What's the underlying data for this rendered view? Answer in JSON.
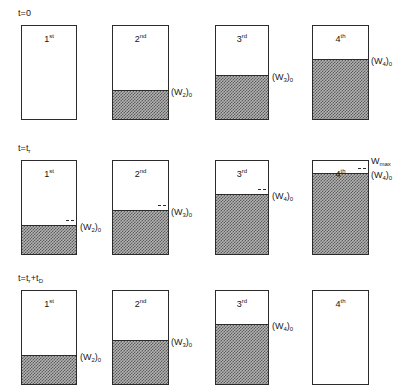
{
  "figure": {
    "type": "process-schematic",
    "vessel_count": 4,
    "row_count": 3
  },
  "rows": [
    {
      "id": "row-t0",
      "time_label": "t=0",
      "time_label_html": "t=0",
      "vessels": [
        {
          "name": "1st",
          "ordinal": "1",
          "suffix": "st",
          "fill_fraction": 0.0,
          "side_label": "",
          "side_label_base": "",
          "side_label_sub": "",
          "tick": false
        },
        {
          "name": "2nd",
          "ordinal": "2",
          "suffix": "nd",
          "fill_fraction": 0.29,
          "side_label": "(W2)0",
          "side_label_base": "(W",
          "side_label_sub": "2",
          "tick": false
        },
        {
          "name": "3rd",
          "ordinal": "3",
          "suffix": "rd",
          "fill_fraction": 0.45,
          "side_label": "(W3)0",
          "side_label_base": "(W",
          "side_label_sub": "3",
          "tick": false
        },
        {
          "name": "4th",
          "ordinal": "4",
          "suffix": "th",
          "fill_fraction": 0.62,
          "side_label": "(W4)0",
          "side_label_base": "(W",
          "side_label_sub": "4",
          "tick": false
        }
      ]
    },
    {
      "id": "row-tr",
      "time_label": "t=tr",
      "time_label_html": "t=t",
      "time_label_sub": "r",
      "vessels": [
        {
          "name": "1st",
          "ordinal": "1",
          "suffix": "st",
          "fill_fraction": 0.29,
          "side_label": "(W2)0",
          "side_label_base": "(W",
          "side_label_sub": "2",
          "tick": true
        },
        {
          "name": "2nd",
          "ordinal": "2",
          "suffix": "nd",
          "fill_fraction": 0.45,
          "side_label": "(W3)0",
          "side_label_base": "(W",
          "side_label_sub": "3",
          "tick": true
        },
        {
          "name": "3rd",
          "ordinal": "3",
          "suffix": "rd",
          "fill_fraction": 0.62,
          "side_label": "(W4)0",
          "side_label_base": "(W",
          "side_label_sub": "4",
          "tick": true
        },
        {
          "name": "4th",
          "ordinal": "4",
          "suffix": "th",
          "fill_fraction": 0.84,
          "side_label": "(W4)0",
          "side_label_base": "(W",
          "side_label_sub": "4",
          "tick": true,
          "top_label": "Wmax",
          "top_label_base": "W",
          "top_label_sub": "max"
        }
      ]
    },
    {
      "id": "row-tr-td",
      "time_label": "t=tr+tD",
      "time_label_html": "t=t",
      "time_label_sub": "r",
      "time_label_html2": "+t",
      "time_label_sub2": "D",
      "vessels": [
        {
          "name": "1st",
          "ordinal": "1",
          "suffix": "st",
          "fill_fraction": 0.29,
          "side_label": "(W2)0",
          "side_label_base": "(W",
          "side_label_sub": "2",
          "tick": false
        },
        {
          "name": "2nd",
          "ordinal": "2",
          "suffix": "nd",
          "fill_fraction": 0.45,
          "side_label": "(W3)0",
          "side_label_base": "(W",
          "side_label_sub": "3",
          "tick": false
        },
        {
          "name": "3rd",
          "ordinal": "3",
          "suffix": "rd",
          "fill_fraction": 0.62,
          "side_label": "(W4)0",
          "side_label_base": "(W",
          "side_label_sub": "4",
          "tick": false
        },
        {
          "name": "4th",
          "ordinal": "4",
          "suffix": "th",
          "fill_fraction": 0.0,
          "side_label": "",
          "side_label_base": "",
          "side_label_sub": "",
          "tick": false
        }
      ]
    }
  ],
  "colors": {
    "outline": "#2b2b2b",
    "fill_light": "#b4b4b4",
    "fill_dark": "#5a5a5a",
    "background": "#ffffff",
    "text": "#171717"
  }
}
